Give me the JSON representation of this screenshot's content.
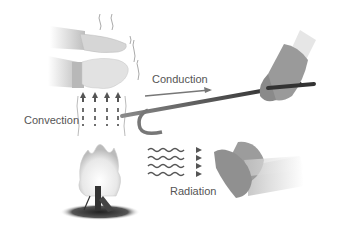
{
  "diagram": {
    "labels": {
      "conduction": "Conduction",
      "convection": "Convection",
      "radiation": "Radiation"
    },
    "elements": [
      "hands-above-fire",
      "gloved-hand-holding-poker",
      "metal-poker",
      "campfire",
      "hands-warming-by-radiation",
      "convection-arrows",
      "radiation-waves",
      "conduction-arrow"
    ]
  }
}
